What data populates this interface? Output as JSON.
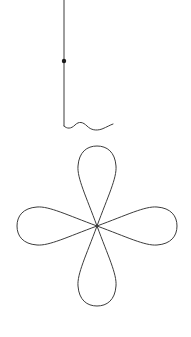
{
  "canvas": {
    "width": 191,
    "height": 337,
    "background_color": "#ffffff",
    "title": "line-drawing-hanging-four-petal-ornament"
  },
  "drawing": {
    "stroke_color": "#3c3c3c",
    "stroke_width": 1,
    "dot_color": "#1a1a1a",
    "elements": [
      {
        "name": "hanging-cord",
        "type": "polyline",
        "points": "64,0 64,126",
        "description": "vertical straight hanging line from top edge down to squiggle start"
      },
      {
        "name": "cord-bead",
        "type": "dot",
        "cx": 64,
        "cy": 61,
        "r": 2.2,
        "description": "small filled round bead on the hanging cord"
      },
      {
        "name": "wavy-squiggle",
        "type": "path",
        "d": "M 64 126 C 67 129 71 129 75 125 C 79 121 83 122 87 126 C 91 130 96 131 102 129 C 107 127 110 125 113 124",
        "description": "short horizontal wave / squiggle at the bottom of the cord"
      },
      {
        "name": "petal-top",
        "type": "path",
        "d": "M 97 226 C 86 196 77 178 78 166 C 79 152 87 146 97 146 C 107 146 115 152 116 166 C 117 178 108 196 97 226 Z",
        "description": "upper teardrop petal"
      },
      {
        "name": "petal-right",
        "type": "path",
        "d": "M 97 226 C 127 215 145 206 157 207 C 171 208 177 216 177 226 C 177 236 171 244 157 245 C 145 246 127 237 97 226 Z",
        "description": "right teardrop petal"
      },
      {
        "name": "petal-bottom",
        "type": "path",
        "d": "M 97 226 C 108 256 117 274 116 286 C 115 300 107 306 97 306 C 87 306 79 300 78 286 C 77 274 86 256 97 226 Z",
        "description": "lower teardrop petal"
      },
      {
        "name": "petal-left",
        "type": "path",
        "d": "M 97 226 C 67 237 49 246 37 245 C 23 244 17 236 17 226 C 17 216 23 208 37 207 C 49 206 67 215 97 226 Z",
        "description": "left teardrop petal"
      }
    ],
    "flower": {
      "center_x": 97,
      "center_y": 226,
      "petal_count": 4,
      "petal_length": 80,
      "petal_width": 40
    }
  }
}
